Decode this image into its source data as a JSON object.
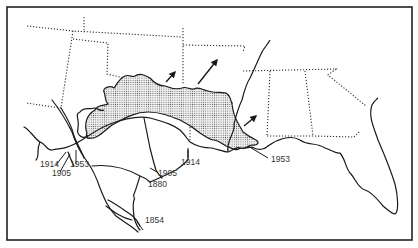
{
  "map": {
    "type": "historical range-expansion map",
    "region": "Southern United States and northern Mexico",
    "legend": null,
    "shaded_area": "dotted stipple region spanning Texas to Louisiana",
    "expansion_arrows": 3,
    "labels": [
      {
        "id": "l1",
        "text": "1914",
        "x": 33,
        "y": 167
      },
      {
        "id": "l2",
        "text": "1953",
        "x": 70,
        "y": 167
      },
      {
        "id": "l3",
        "text": "1905",
        "x": 38,
        "y": 176
      },
      {
        "id": "l4",
        "text": "1914",
        "x": 181,
        "y": 165
      },
      {
        "id": "l5",
        "text": "1905",
        "x": 158,
        "y": 176
      },
      {
        "id": "l6",
        "text": "1880",
        "x": 148,
        "y": 187
      },
      {
        "id": "l7",
        "text": "1854",
        "x": 145,
        "y": 223
      },
      {
        "id": "l8",
        "text": "1953",
        "x": 271,
        "y": 162
      }
    ]
  }
}
